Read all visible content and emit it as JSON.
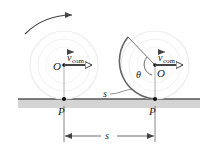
{
  "diagram": {
    "colors": {
      "background": "#ffffff",
      "ground_strip": "#d4d4d4",
      "ground_line": "#555555",
      "wheel_outline": "#ececec",
      "arc_highlight": "#555555",
      "arrow": "#444444",
      "text": "#222222"
    },
    "left_wheel": {
      "center_label": "O",
      "velocity_label": "v",
      "velocity_subscript": "com",
      "contact_label": "P"
    },
    "right_wheel": {
      "center_label": "O",
      "velocity_label": "v",
      "velocity_subscript": "com",
      "contact_label": "P",
      "angle_label": "θ",
      "arc_label": "s"
    },
    "rotation_arrow": {
      "direction": "clockwise"
    },
    "dimension": {
      "label": "s"
    }
  }
}
